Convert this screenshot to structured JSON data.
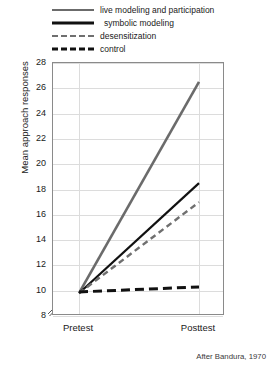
{
  "chart_data": {
    "type": "line",
    "title": "",
    "xlabel": "",
    "ylabel": "Mean approach responses",
    "categories": [
      "Pretest",
      "Posttest"
    ],
    "x": [
      0,
      1
    ],
    "ylim": [
      8,
      28
    ],
    "yticks": [
      8,
      10,
      12,
      14,
      16,
      18,
      20,
      22,
      24,
      26,
      28
    ],
    "grid": true,
    "y_axis_break": true,
    "legend_position": "above-plot",
    "source_note": "After Bandura, 1970",
    "series": [
      {
        "name": "live modeling and participation",
        "values": [
          9.8,
          26.5
        ],
        "style": "solid",
        "color": "#6b6b6b",
        "width": 2.6
      },
      {
        "name": "symbolic modeling",
        "values": [
          9.8,
          18.5
        ],
        "style": "solid",
        "color": "#111111",
        "width": 2.2
      },
      {
        "name": "desensitization",
        "values": [
          9.8,
          17.0
        ],
        "style": "dashed",
        "color": "#6f6f6f",
        "width": 2.4
      },
      {
        "name": "control",
        "values": [
          9.9,
          10.3
        ],
        "style": "dashed",
        "color": "#111111",
        "width": 3.0
      }
    ]
  },
  "legend": {
    "items": [
      {
        "label": "live modeling and participation",
        "swatch": "solid-gray"
      },
      {
        "label": "symbolic modeling",
        "swatch": "solid-black"
      },
      {
        "label": "desensitization",
        "swatch": "dash-gray"
      },
      {
        "label": "control",
        "swatch": "dash-black"
      }
    ]
  },
  "axes": {
    "y_label": "Mean approach responses",
    "y_ticks": [
      "28",
      "26",
      "24",
      "22",
      "20",
      "18",
      "16",
      "14",
      "12",
      "10",
      "8"
    ],
    "x_ticks": [
      "Pretest",
      "Posttest"
    ]
  },
  "footer": {
    "source": "After Bandura, 1970"
  }
}
